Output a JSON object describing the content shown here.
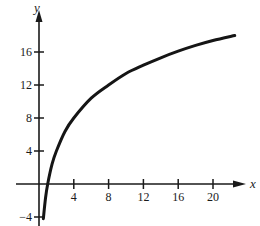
{
  "chart_data": {
    "type": "line",
    "title": "",
    "xlabel": "x",
    "ylabel": "y",
    "xlim": [
      -4,
      24
    ],
    "ylim": [
      -5,
      20
    ],
    "x_ticks": [
      4,
      8,
      12,
      16,
      20
    ],
    "x_tick_labels": [
      "4",
      "8",
      "12",
      "16",
      "20"
    ],
    "y_ticks": [
      -4,
      4,
      8,
      12,
      16
    ],
    "y_tick_labels": [
      "−4",
      "4",
      "8",
      "12",
      "16"
    ],
    "grid": false,
    "legend": null,
    "series": [
      {
        "name": "y = f(x) (logarithmic curve)",
        "x": [
          0.5,
          0.75,
          1,
          1.5,
          2,
          3,
          4,
          6,
          8,
          10,
          12,
          14,
          16,
          18,
          20,
          22.5
        ],
        "y": [
          -4.2,
          -1.7,
          0,
          2.4,
          4.0,
          6.4,
          8.0,
          10.4,
          12.0,
          13.4,
          14.4,
          15.3,
          16.1,
          16.8,
          17.4,
          18.0
        ]
      }
    ]
  },
  "axes": {
    "x_label": "x",
    "y_label": "y"
  }
}
